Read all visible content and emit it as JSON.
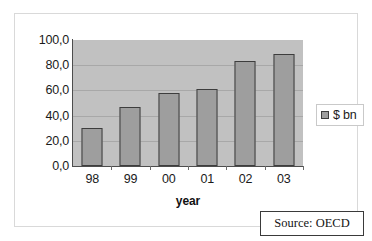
{
  "chart_data": {
    "type": "bar",
    "title": "",
    "xlabel": "year",
    "ylabel": "",
    "categories": [
      "98",
      "99",
      "00",
      "01",
      "02",
      "03"
    ],
    "values": [
      30.0,
      47.0,
      58.0,
      61.5,
      83.0,
      89.0
    ],
    "series": [
      {
        "name": "$ bn",
        "values": [
          30.0,
          47.0,
          58.0,
          61.5,
          83.0,
          89.0
        ]
      }
    ],
    "ylim": [
      0,
      100
    ],
    "ytick_labels": [
      "100,0",
      "80,0",
      "60,0",
      "40,0",
      "20,0",
      "0,0"
    ],
    "ytick_values": [
      100,
      80,
      60,
      40,
      20,
      0
    ],
    "grid": true,
    "legend": {
      "position": "right",
      "entries": [
        "$ bn"
      ]
    },
    "annotations": [
      "Source: OECD"
    ],
    "colors": {
      "bar_fill": "#9e9e9e",
      "bar_border": "#3d3d3d",
      "plot_background": "#c1c1c1",
      "gridline": "#a8a8a8",
      "axis": "#4d4d4d",
      "text": "#1a1a1a"
    }
  },
  "legend": {
    "label": "$ bn",
    "swatch_name": "legend-color-swatch"
  },
  "source": {
    "text": "Source: OECD"
  },
  "axis": {
    "x_title": "year"
  }
}
